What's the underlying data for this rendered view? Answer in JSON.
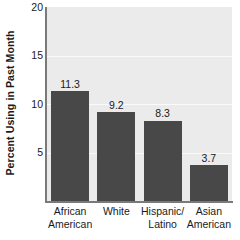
{
  "chart_data": {
    "type": "bar",
    "title": "",
    "subtitle": "",
    "xlabel": "",
    "ylabel": "Percent Using in Past Month",
    "categories": [
      "African American",
      "White",
      "Hispanic/ Latino",
      "Asian American"
    ],
    "category_lines": [
      [
        "African",
        "American"
      ],
      [
        "White",
        ""
      ],
      [
        "Hispanic/",
        "Latino"
      ],
      [
        "Asian",
        "American"
      ]
    ],
    "values": [
      11.3,
      9.2,
      8.3,
      3.7
    ],
    "value_labels": [
      "11.3",
      "9.2",
      "8.3",
      "3.7"
    ],
    "ylim": [
      0,
      20
    ],
    "yticks": [
      5,
      10,
      15,
      20
    ],
    "ytick_labels": [
      "5",
      "10",
      "15",
      "20"
    ],
    "grid": true,
    "legend": "none",
    "colors": {
      "bar": "#484848",
      "plot_background": "#ebebeb",
      "page_background": "#ffffff",
      "axis": "#7a7a7a",
      "gridline": "#fafafa",
      "text": "#1a1a1a"
    }
  }
}
